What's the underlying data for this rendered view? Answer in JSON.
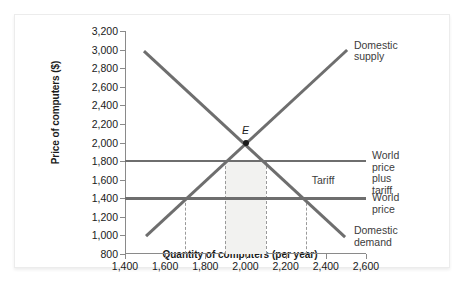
{
  "chart_data": {
    "type": "line",
    "title": "",
    "xlabel": "Quantity of computers (per year)",
    "ylabel": "Price of computers ($)",
    "xlim": [
      1400,
      2600
    ],
    "ylim": [
      800,
      3200
    ],
    "xticks": [
      "1,400",
      "1,600",
      "1,800",
      "2,000",
      "2,200",
      "2,400",
      "2,600"
    ],
    "xtick_values": [
      1400,
      1600,
      1800,
      2000,
      2200,
      2400,
      2600
    ],
    "yticks": [
      "800",
      "1,000",
      "1,200",
      "1,400",
      "1,600",
      "1,800",
      "2,000",
      "2,200",
      "2,400",
      "2,600",
      "2,800",
      "3,000",
      "3,200"
    ],
    "ytick_values": [
      800,
      1000,
      1200,
      1400,
      1600,
      1800,
      2000,
      2200,
      2400,
      2600,
      2800,
      3000,
      3200
    ],
    "grid": false,
    "legend_position": "right-inline-labels",
    "series": [
      {
        "name": "Domestic supply",
        "type": "line",
        "x": [
          1500,
          2500
        ],
        "y": [
          1000,
          3000
        ],
        "label": "Domestic\nsupply"
      },
      {
        "name": "Domestic demand",
        "type": "line",
        "x": [
          1500,
          2500
        ],
        "y": [
          3000,
          1000
        ],
        "label": "Domestic\ndemand"
      },
      {
        "name": "World price plus tariff",
        "type": "hline",
        "y": 1800,
        "x": [
          1400,
          2600
        ],
        "label": "World price\nplus tariff"
      },
      {
        "name": "World price",
        "type": "hline",
        "y": 1400,
        "x": [
          1400,
          2600
        ],
        "label": "World price"
      }
    ],
    "annotations": [
      {
        "name": "equilibrium-point",
        "label": "E",
        "x": 2000,
        "y": 2000
      },
      {
        "name": "tariff-gap-label",
        "label": "Tariff",
        "x": 2330,
        "y": 1600
      }
    ],
    "dashed_lines": [
      {
        "name": "supply-quantity-at-world-price",
        "x": 1700,
        "y_from": 800,
        "y_to": 1400
      },
      {
        "name": "supply-quantity-at-world-price-plus-tariff",
        "x": 1900,
        "y_from": 800,
        "y_to": 1800
      },
      {
        "name": "demand-quantity-at-world-price-plus-tariff",
        "x": 2100,
        "y_from": 800,
        "y_to": 1800
      },
      {
        "name": "demand-quantity-at-world-price",
        "x": 2300,
        "y_from": 800,
        "y_to": 1400
      }
    ],
    "shaded_regions": [
      {
        "name": "tariff-revenue-region",
        "x_from": 1900,
        "x_to": 2100,
        "y_from": 800,
        "y_to": 1800,
        "color": "#f2f2f0"
      }
    ],
    "colors": {
      "line": "#6e6e6e",
      "axis": "#8a8a8a",
      "text": "#1a1a1a",
      "label_text": "#3c3c3c",
      "dashed": "#9a9a9a",
      "shade": "#f2f2f0",
      "background": "#ffffff",
      "card_border": "#ececec"
    }
  }
}
